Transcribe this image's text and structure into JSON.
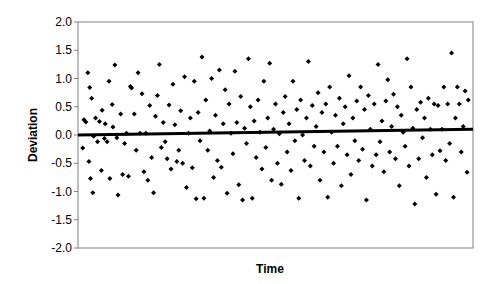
{
  "chart_data": {
    "type": "scatter",
    "title": "",
    "xlabel": "Time",
    "ylabel": "Deviation",
    "ylim": [
      -2.0,
      2.0
    ],
    "yticks": [
      "2.0",
      "1.5",
      "1.0",
      "0.5",
      "0.0",
      "-0.5",
      "-1.0",
      "-1.5",
      "-2.0"
    ],
    "xticks": [],
    "grid": false,
    "legend": null,
    "trendline": {
      "x_start": 0,
      "y_start": 0.0,
      "x_end": 1,
      "y_end": 0.1
    },
    "series": [
      {
        "name": "Deviation",
        "marker": "diamond",
        "points": [
          [
            0.002,
            -0.23
          ],
          [
            0.005,
            0.27
          ],
          [
            0.01,
            0.23
          ],
          [
            0.015,
            1.1
          ],
          [
            0.018,
            -0.47
          ],
          [
            0.02,
            0.84
          ],
          [
            0.022,
            -0.77
          ],
          [
            0.025,
            0.65
          ],
          [
            0.028,
            -1.02
          ],
          [
            0.03,
            -0.02
          ],
          [
            0.035,
            0.3
          ],
          [
            0.04,
            -0.12
          ],
          [
            0.045,
            0.24
          ],
          [
            0.05,
            -0.63
          ],
          [
            0.052,
            0.44
          ],
          [
            0.058,
            -0.06
          ],
          [
            0.06,
            0.2
          ],
          [
            0.065,
            -0.12
          ],
          [
            0.07,
            0.95
          ],
          [
            0.072,
            -0.77
          ],
          [
            0.078,
            0.54
          ],
          [
            0.08,
            0.14
          ],
          [
            0.085,
            1.24
          ],
          [
            0.09,
            -0.05
          ],
          [
            0.093,
            -1.06
          ],
          [
            0.1,
            0.37
          ],
          [
            0.105,
            -0.7
          ],
          [
            0.11,
            -0.15
          ],
          [
            0.115,
            0.03
          ],
          [
            0.12,
            -0.73
          ],
          [
            0.125,
            0.86
          ],
          [
            0.128,
            0.83
          ],
          [
            0.135,
            0.37
          ],
          [
            0.14,
            -0.27
          ],
          [
            0.145,
            1.1
          ],
          [
            0.15,
            0.03
          ],
          [
            0.155,
            0.73
          ],
          [
            0.16,
            -0.65
          ],
          [
            0.165,
            0.03
          ],
          [
            0.17,
            -0.8
          ],
          [
            0.175,
            0.52
          ],
          [
            0.18,
            -0.4
          ],
          [
            0.185,
            -1.02
          ],
          [
            0.19,
            0.33
          ],
          [
            0.195,
            0.7
          ],
          [
            0.2,
            1.25
          ],
          [
            0.205,
            -0.22
          ],
          [
            0.21,
            0.22
          ],
          [
            0.215,
            -0.12
          ],
          [
            0.22,
            -0.42
          ],
          [
            0.225,
            0.53
          ],
          [
            0.23,
            -0.6
          ],
          [
            0.235,
            0.9
          ],
          [
            0.24,
            0.18
          ],
          [
            0.245,
            -0.47
          ],
          [
            0.25,
            -0.27
          ],
          [
            0.255,
            0.43
          ],
          [
            0.26,
            -0.5
          ],
          [
            0.265,
            1.03
          ],
          [
            0.27,
            -0.93
          ],
          [
            0.275,
            0.03
          ],
          [
            0.28,
            0.3
          ],
          [
            0.285,
            -0.58
          ],
          [
            0.29,
            0.95
          ],
          [
            0.295,
            -1.13
          ],
          [
            0.3,
            0.4
          ],
          [
            0.305,
            -0.1
          ],
          [
            0.31,
            1.38
          ],
          [
            0.315,
            -1.12
          ],
          [
            0.32,
            0.62
          ],
          [
            0.325,
            -0.27
          ],
          [
            0.33,
            0.07
          ],
          [
            0.335,
            1.0
          ],
          [
            0.34,
            -0.75
          ],
          [
            0.345,
            0.35
          ],
          [
            0.35,
            -0.45
          ],
          [
            0.355,
            1.15
          ],
          [
            0.36,
            -0.57
          ],
          [
            0.365,
            0.2
          ],
          [
            0.37,
            0.8
          ],
          [
            0.375,
            -1.03
          ],
          [
            0.38,
            0.55
          ],
          [
            0.385,
            0.03
          ],
          [
            0.39,
            -0.33
          ],
          [
            0.395,
            1.13
          ],
          [
            0.4,
            0.22
          ],
          [
            0.405,
            -0.88
          ],
          [
            0.41,
            0.68
          ],
          [
            0.415,
            -1.15
          ],
          [
            0.42,
            0.12
          ],
          [
            0.425,
            -0.15
          ],
          [
            0.43,
            1.35
          ],
          [
            0.435,
            0.5
          ],
          [
            0.44,
            -1.12
          ],
          [
            0.445,
            0.25
          ],
          [
            0.45,
            -0.4
          ],
          [
            0.455,
            0.62
          ],
          [
            0.46,
            0.05
          ],
          [
            0.465,
            -0.6
          ],
          [
            0.47,
            0.95
          ],
          [
            0.475,
            -0.22
          ],
          [
            0.48,
            0.3
          ],
          [
            0.485,
            1.27
          ],
          [
            0.49,
            -0.8
          ],
          [
            0.495,
            0.1
          ],
          [
            0.5,
            0.55
          ],
          [
            0.505,
            -0.5
          ],
          [
            0.51,
            0.02
          ],
          [
            0.515,
            -0.87
          ],
          [
            0.52,
            0.4
          ],
          [
            0.525,
            0.68
          ],
          [
            0.53,
            -0.3
          ],
          [
            0.535,
            0.2
          ],
          [
            0.54,
            -0.63
          ],
          [
            0.545,
            0.95
          ],
          [
            0.55,
            -0.1
          ],
          [
            0.555,
            0.45
          ],
          [
            0.56,
            -1.12
          ],
          [
            0.565,
            0.62
          ],
          [
            0.57,
            0.0
          ],
          [
            0.575,
            -0.45
          ],
          [
            0.58,
            0.3
          ],
          [
            0.585,
            1.3
          ],
          [
            0.59,
            -0.55
          ],
          [
            0.595,
            0.52
          ],
          [
            0.6,
            -0.2
          ],
          [
            0.605,
            0.15
          ],
          [
            0.61,
            0.75
          ],
          [
            0.615,
            -0.8
          ],
          [
            0.62,
            0.4
          ],
          [
            0.625,
            -0.3
          ],
          [
            0.63,
            0.55
          ],
          [
            0.635,
            -1.1
          ],
          [
            0.64,
            0.85
          ],
          [
            0.645,
            0.05
          ],
          [
            0.65,
            -0.5
          ],
          [
            0.655,
            0.35
          ],
          [
            0.66,
            -0.2
          ],
          [
            0.665,
            0.65
          ],
          [
            0.67,
            -0.9
          ],
          [
            0.675,
            0.2
          ],
          [
            0.68,
            0.5
          ],
          [
            0.685,
            -0.35
          ],
          [
            0.69,
            1.05
          ],
          [
            0.695,
            -0.7
          ],
          [
            0.7,
            0.3
          ],
          [
            0.705,
            -0.1
          ],
          [
            0.71,
            0.6
          ],
          [
            0.715,
            -0.45
          ],
          [
            0.72,
            0.85
          ],
          [
            0.725,
            -0.25
          ],
          [
            0.73,
            0.45
          ],
          [
            0.735,
            -1.15
          ],
          [
            0.74,
            0.7
          ],
          [
            0.745,
            0.1
          ],
          [
            0.75,
            -0.55
          ],
          [
            0.755,
            0.55
          ],
          [
            0.76,
            -0.35
          ],
          [
            0.765,
            1.25
          ],
          [
            0.77,
            -0.12
          ],
          [
            0.775,
            0.25
          ],
          [
            0.78,
            -0.65
          ],
          [
            0.785,
            0.6
          ],
          [
            0.79,
            0.98
          ],
          [
            0.795,
            -0.3
          ],
          [
            0.8,
            0.15
          ],
          [
            0.805,
            0.72
          ],
          [
            0.81,
            -0.42
          ],
          [
            0.815,
            0.5
          ],
          [
            0.82,
            -0.9
          ],
          [
            0.825,
            0.35
          ],
          [
            0.83,
            0.05
          ],
          [
            0.835,
            -0.2
          ],
          [
            0.84,
            1.35
          ],
          [
            0.845,
            -0.55
          ],
          [
            0.85,
            0.85
          ],
          [
            0.855,
            0.12
          ],
          [
            0.86,
            -1.22
          ],
          [
            0.865,
            0.45
          ],
          [
            0.87,
            -0.42
          ],
          [
            0.875,
            0.58
          ],
          [
            0.88,
            -0.05
          ],
          [
            0.885,
            0.3
          ],
          [
            0.89,
            -0.75
          ],
          [
            0.895,
            0.65
          ],
          [
            0.9,
            0.1
          ],
          [
            0.905,
            -0.35
          ],
          [
            0.91,
            0.55
          ],
          [
            0.915,
            -1.05
          ],
          [
            0.92,
            0.52
          ],
          [
            0.925,
            -0.28
          ],
          [
            0.93,
            0.1
          ],
          [
            0.935,
            0.85
          ],
          [
            0.94,
            -0.45
          ],
          [
            0.945,
            0.55
          ],
          [
            0.95,
            -0.15
          ],
          [
            0.955,
            1.45
          ],
          [
            0.96,
            -1.1
          ],
          [
            0.965,
            0.3
          ],
          [
            0.97,
            0.85
          ],
          [
            0.975,
            0.55
          ],
          [
            0.98,
            -0.3
          ],
          [
            0.985,
            0.15
          ],
          [
            0.99,
            0.78
          ],
          [
            0.995,
            -0.66
          ],
          [
            0.998,
            0.62
          ]
        ]
      }
    ]
  }
}
